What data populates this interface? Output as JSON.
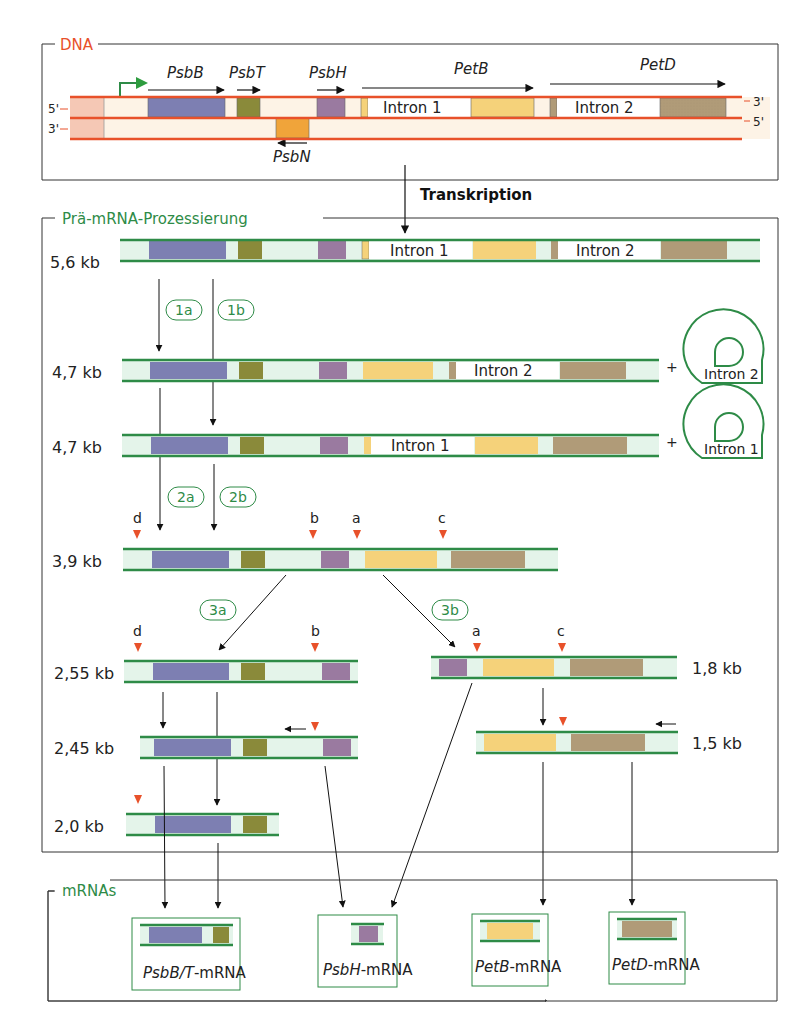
{
  "colors": {
    "dna_strand": "#e8512a",
    "rna_strand": "#2e8b47",
    "section_dna": "#e8512a",
    "section_green": "#2e8b47",
    "psbB": "#7d7fb2",
    "psbT": "#8a8a3a",
    "psbH": "#9a7aa0",
    "petB": "#f5d27a",
    "petD": "#b09b78",
    "psbN": "#f0a43a",
    "rna_spacer": "#e4f4ea",
    "dna_spacer": "#fdf3e6",
    "promoter_region": "#f5c8b5",
    "processing_site": "#e8512a"
  },
  "sections": {
    "dna": "DNA",
    "prae_mrna": "Prä-mRNA-Prozessierung",
    "mrnas": "mRNAs"
  },
  "transcription_label": "Transkription",
  "dna": {
    "strand_5prime_top": "5'",
    "strand_3prime_bottom": "3'",
    "strand_3prime_right": "3'",
    "strand_5prime_right": "5'",
    "genes": [
      "PsbB",
      "PsbT",
      "PsbH",
      "PetB",
      "PetD",
      "PsbN"
    ],
    "introns": [
      "Intron 1",
      "Intron 2"
    ]
  },
  "steps": {
    "s1a": "1a",
    "s1b": "1b",
    "s2a": "2a",
    "s2b": "2b",
    "s3a": "3a",
    "s3b": "3b"
  },
  "sizes": {
    "r56": "5,6 kb",
    "r47a": "4,7 kb",
    "r47b": "4,7 kb",
    "r39": "3,9 kb",
    "r255": "2,55 kb",
    "r245": "2,45 kb",
    "r20": "2,0 kb",
    "r18": "1,8 kb",
    "r15": "1,5 kb"
  },
  "sites": {
    "a": "a",
    "b": "b",
    "c": "c",
    "d": "d"
  },
  "plus": "+",
  "lariat": {
    "l2": "Intron 2",
    "l1": "Intron 1"
  },
  "mrna_products": [
    {
      "gene": "PsbB/T",
      "suffix": "-mRNA"
    },
    {
      "gene": "PsbH",
      "suffix": "-mRNA"
    },
    {
      "gene": "PetB",
      "suffix": "-mRNA"
    },
    {
      "gene": "PetD",
      "suffix": "-mRNA"
    }
  ]
}
